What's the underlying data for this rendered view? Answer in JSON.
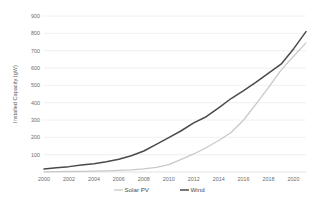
{
  "chart_data": {
    "type": "line",
    "title": "",
    "subtitle": "",
    "xlabel": "",
    "ylabel": "Installed Capacity (gW)",
    "xlim": [
      2000,
      2021
    ],
    "ylim": [
      0,
      900
    ],
    "grid": true,
    "grid_axis": "y",
    "legend_position": "bottom",
    "x_tick_labels": [
      "2000",
      "2002",
      "2004",
      "2006",
      "2008",
      "2010",
      "2012",
      "2014",
      "2016",
      "2018",
      "2020"
    ],
    "x_ticks": [
      2000,
      2002,
      2004,
      2006,
      2008,
      2010,
      2012,
      2014,
      2016,
      2018,
      2020
    ],
    "y_tick_labels": [
      "100",
      "200",
      "300",
      "400",
      "500",
      "600",
      "700",
      "800",
      "900"
    ],
    "y_ticks": [
      100,
      200,
      300,
      400,
      500,
      600,
      700,
      800,
      900
    ],
    "x": [
      2000,
      2001,
      2002,
      2003,
      2004,
      2005,
      2006,
      2007,
      2008,
      2009,
      2010,
      2011,
      2012,
      2013,
      2014,
      2015,
      2016,
      2017,
      2018,
      2019,
      2020,
      2021
    ],
    "series": [
      {
        "name": "Solar PV",
        "color": "#c9c9c9",
        "width": 1.3,
        "values": [
          1,
          2,
          3,
          4,
          5,
          7,
          9,
          12,
          18,
          27,
          42,
          73,
          104,
          140,
          182,
          228,
          300,
          393,
          488,
          588,
          668,
          745
        ]
      },
      {
        "name": "Wind",
        "color": "#4a4a4a",
        "width": 1.5,
        "values": [
          18,
          24,
          31,
          40,
          48,
          59,
          74,
          94,
          121,
          159,
          198,
          238,
          283,
          319,
          370,
          424,
          470,
          518,
          570,
          622,
          710,
          810
        ]
      }
    ]
  },
  "legend": {
    "items": [
      {
        "label": "Solar PV",
        "color": "#c9c9c9"
      },
      {
        "label": "Wind",
        "color": "#4a4a4a"
      }
    ]
  },
  "style": {
    "background": "#ffffff",
    "gridline_color": "#e4e4e4",
    "baseline_color": "#d2d2d2",
    "tick_text_color": "#6d6d6d",
    "axis_title_color": "#5f5f5f"
  }
}
